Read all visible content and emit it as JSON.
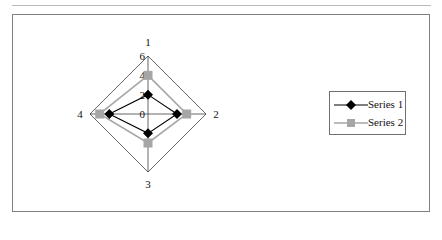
{
  "chart_data": {
    "type": "radar",
    "categories": [
      "1",
      "2",
      "3",
      "4"
    ],
    "series": [
      {
        "name": "Series 1",
        "values": [
          2,
          3,
          2,
          4
        ],
        "color": "#000000",
        "marker": "diamond"
      },
      {
        "name": "Series 2",
        "values": [
          4,
          4,
          3,
          5
        ],
        "color": "#a6a6a6",
        "marker": "square"
      }
    ],
    "title": "",
    "radial_ticks": [
      "0",
      "2",
      "4",
      "6"
    ],
    "rlim": [
      0,
      6
    ],
    "grid": "outer ring only",
    "legend_position": "right"
  },
  "legend": {
    "items": [
      {
        "label": "Series 1"
      },
      {
        "label": "Series 2"
      }
    ]
  }
}
